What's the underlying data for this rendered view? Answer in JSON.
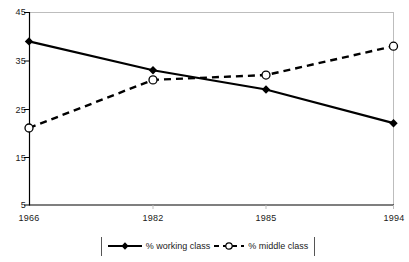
{
  "chart_data": {
    "type": "line",
    "title": "",
    "xlabel": "",
    "ylabel": "",
    "categories": [
      "1966",
      "1982",
      "1985",
      "1994"
    ],
    "ylim": [
      5,
      45
    ],
    "yticks": [
      5,
      15,
      25,
      35,
      45
    ],
    "grid": false,
    "legend_position": "bottom",
    "series": [
      {
        "name": "% working class",
        "values": [
          39,
          33,
          29,
          22
        ],
        "marker": "diamond",
        "line_style": "solid",
        "color": "#000000"
      },
      {
        "name": "% middle class",
        "values": [
          21,
          31,
          32,
          38
        ],
        "marker": "circle-open",
        "line_style": "dashed",
        "color": "#000000"
      }
    ]
  },
  "axes": {
    "y_tick_labels": [
      "45",
      "35",
      "25",
      "15",
      "5"
    ],
    "x_tick_labels": [
      "1966",
      "1982",
      "1985",
      "1994"
    ]
  },
  "legend": {
    "items": [
      {
        "label": "% working class",
        "marker": "diamond-solid-line"
      },
      {
        "label": "% middle class",
        "marker": "circle-dashed-line"
      }
    ]
  },
  "colors": {
    "axis": "#000000",
    "frame": "#bdbdbd",
    "series": "#000000",
    "text": "#1a1a1a"
  }
}
